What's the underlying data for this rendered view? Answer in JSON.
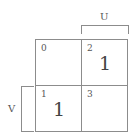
{
  "kmap": {
    "column_label": "U",
    "row_label": "V",
    "cells": [
      {
        "index": "0",
        "value": ""
      },
      {
        "index": "2",
        "value": "1"
      },
      {
        "index": "1",
        "value": "1"
      },
      {
        "index": "3",
        "value": ""
      }
    ]
  },
  "colors": {
    "line": "#8c8c8c",
    "text": "#444444"
  }
}
